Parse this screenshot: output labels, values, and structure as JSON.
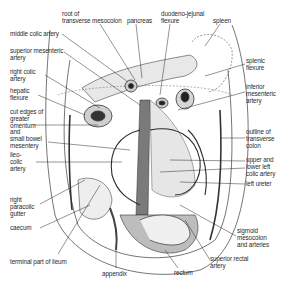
{
  "figure": {
    "colors": {
      "ink": "#2a2a2a",
      "tissue": "#d9d9d9",
      "shadow": "#5a5a5a",
      "background": "#ffffff"
    }
  },
  "labels": [
    {
      "id": "root-transverse-mesocolon",
      "text": "root of\ntransverse mesocolon",
      "x": 62,
      "y": 11
    },
    {
      "id": "pancreas",
      "text": "pancreas",
      "x": 127,
      "y": 18
    },
    {
      "id": "duodeno-jejunal-flexure",
      "text": "duodeno-jejunal\nflexure",
      "x": 161,
      "y": 11
    },
    {
      "id": "spleen",
      "text": "spleen",
      "x": 213,
      "y": 18
    },
    {
      "id": "middle-colic-artery",
      "text": "middle colic artery",
      "x": 10,
      "y": 31
    },
    {
      "id": "superior-mesenteric-artery",
      "text": "superior mesenteric\nartery",
      "x": 10,
      "y": 48
    },
    {
      "id": "right-colic-artery",
      "text": "right colic\nartery",
      "x": 10,
      "y": 69
    },
    {
      "id": "hepatic-flexure",
      "text": "hepatic\nflexure",
      "x": 10,
      "y": 88
    },
    {
      "id": "splenic-flexure",
      "text": "splenic\nflexure",
      "x": 246,
      "y": 58
    },
    {
      "id": "inferior-mesenteric-artery",
      "text": "inferior\nmesenteric\nartery",
      "x": 246,
      "y": 84
    },
    {
      "id": "cut-edges",
      "text": "cut edges of\ngreater\nomentum\nand\nsmall bowel\nmesentery",
      "x": 10,
      "y": 109
    },
    {
      "id": "ileo-colic-artery",
      "text": "ileo-\ncolic\nartery",
      "x": 10,
      "y": 152
    },
    {
      "id": "outline-transverse-colon",
      "text": "outline of\ntransverse\ncolon",
      "x": 246,
      "y": 129
    },
    {
      "id": "upper-lower-left-colic-artery",
      "text": "upper and\nlower left\ncolic artery",
      "x": 246,
      "y": 157
    },
    {
      "id": "left-ureter",
      "text": "left ureter",
      "x": 246,
      "y": 181
    },
    {
      "id": "right-paracolic-gutter",
      "text": "right\nparacolic\ngutter",
      "x": 10,
      "y": 197
    },
    {
      "id": "caecum",
      "text": "caecum",
      "x": 10,
      "y": 225
    },
    {
      "id": "sigmoid-mesocolon",
      "text": "sigmoid\nmesocolon\nand arteries",
      "x": 237,
      "y": 228
    },
    {
      "id": "terminal-ileum",
      "text": "terminal part of ileum",
      "x": 10,
      "y": 259
    },
    {
      "id": "superior-rectal-artery",
      "text": "superior rectal\nartery",
      "x": 210,
      "y": 256
    },
    {
      "id": "appendix",
      "text": "appendix",
      "x": 102,
      "y": 271
    },
    {
      "id": "rectum",
      "text": "rectum",
      "x": 174,
      "y": 270
    }
  ]
}
